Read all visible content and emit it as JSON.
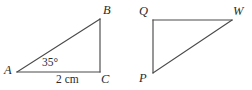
{
  "figure": {
    "background_color": "#ffffff",
    "line_color": "#4a4a4a",
    "text_color": "#2b2b2b",
    "triangles": [
      {
        "name": "triangle-ABC",
        "vertices": [
          {
            "label": "A",
            "x": 17,
            "y": 72
          },
          {
            "label": "B",
            "x": 100,
            "y": 19
          },
          {
            "label": "C",
            "x": 100,
            "y": 72
          }
        ],
        "right_angle_at": "C",
        "annotations": [
          {
            "name": "angle-at-A",
            "text": "35°"
          },
          {
            "name": "side-AC-length",
            "text": "2 cm"
          }
        ]
      },
      {
        "name": "triangle-PQW",
        "vertices": [
          {
            "label": "Q",
            "x": 153,
            "y": 20
          },
          {
            "label": "W",
            "x": 232,
            "y": 20
          },
          {
            "label": "P",
            "x": 153,
            "y": 73
          }
        ],
        "right_angle_at": "Q",
        "annotations": []
      }
    ]
  },
  "labels": {
    "A": "A",
    "B": "B",
    "C": "C",
    "Q": "Q",
    "W": "W",
    "P": "P",
    "angle": "35°",
    "base": "2 cm"
  }
}
